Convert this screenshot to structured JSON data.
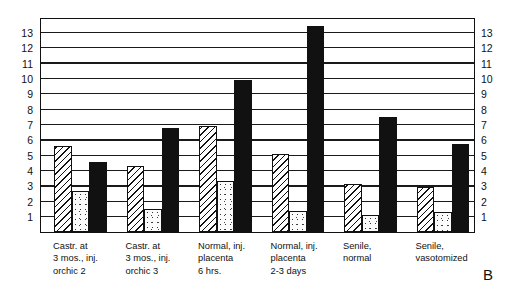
{
  "panel": {
    "letter": "B"
  },
  "chart_data": {
    "type": "bar",
    "title": "",
    "xlabel": "",
    "ylabel": "",
    "ylim": [
      0,
      14
    ],
    "grid": true,
    "legend_position": "none",
    "y_ticks_left": [
      "13",
      "12",
      "11",
      "10",
      "9",
      "8",
      "7",
      "6",
      "5",
      "4",
      "3",
      "2",
      "1"
    ],
    "y_ticks_right": [
      "13",
      "12",
      "11",
      "10",
      "9",
      "8",
      "7",
      "6",
      "5",
      "4",
      "3",
      "2",
      "1"
    ],
    "categories": [
      "Castr. at\n3 mos., inj.\norchic 2",
      "Castr. at\n3 mos., inj.\norchic 3",
      "Normal, inj.\nplacenta\n6 hrs.",
      "Normal, inj.\nplacenta\n2-3 days",
      "Senile,\nnormal",
      "Senile,\nvasotomized"
    ],
    "series": [
      {
        "name": "hatched",
        "fill": "hatched",
        "values": [
          5.6,
          4.3,
          6.9,
          5.1,
          3.1,
          2.9
        ]
      },
      {
        "name": "dotted",
        "fill": "dotted",
        "values": [
          2.7,
          1.5,
          3.3,
          1.4,
          1.1,
          1.3
        ]
      },
      {
        "name": "solid",
        "fill": "solid",
        "values": [
          4.55,
          6.8,
          9.9,
          13.4,
          7.5,
          5.7
        ]
      }
    ]
  }
}
